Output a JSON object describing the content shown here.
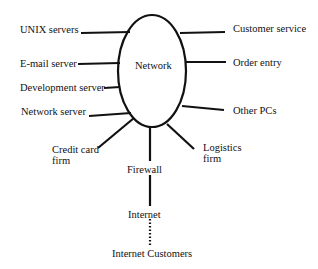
{
  "diagram": {
    "center": {
      "label": "Network"
    },
    "left_nodes": [
      {
        "id": "unix",
        "label": "UNIX servers"
      },
      {
        "id": "email",
        "label": "E-mail server"
      },
      {
        "id": "dev",
        "label": "Development server"
      },
      {
        "id": "netserver",
        "label": "Network server"
      }
    ],
    "right_nodes": [
      {
        "id": "custsvc",
        "label": "Customer service"
      },
      {
        "id": "order",
        "label": "Order entry"
      },
      {
        "id": "otherpcs",
        "label": "Other PCs"
      }
    ],
    "bottom_nodes": {
      "credit_card": {
        "line1": "Credit card",
        "line2": "firm"
      },
      "logistics": {
        "line1": "Logistics",
        "line2": "firm"
      },
      "firewall": {
        "label": "Firewall"
      },
      "internet": {
        "label": "Internet"
      },
      "internet_customers": {
        "label": "Internet Customers"
      }
    },
    "connections": [
      {
        "from": "UNIX servers",
        "to": "Network",
        "style": "solid"
      },
      {
        "from": "E-mail server",
        "to": "Network",
        "style": "solid"
      },
      {
        "from": "Development server",
        "to": "Network",
        "style": "solid"
      },
      {
        "from": "Network server",
        "to": "Network",
        "style": "solid"
      },
      {
        "from": "Customer service",
        "to": "Network",
        "style": "solid"
      },
      {
        "from": "Order entry",
        "to": "Network",
        "style": "solid"
      },
      {
        "from": "Other PCs",
        "to": "Network",
        "style": "solid"
      },
      {
        "from": "Credit card firm",
        "to": "Network",
        "style": "solid"
      },
      {
        "from": "Logistics firm",
        "to": "Network",
        "style": "solid"
      },
      {
        "from": "Firewall",
        "to": "Network",
        "style": "solid"
      },
      {
        "from": "Internet",
        "to": "Firewall",
        "style": "solid"
      },
      {
        "from": "Internet Customers",
        "to": "Internet",
        "style": "dotted"
      }
    ],
    "colors": {
      "line": "#111111",
      "background": "#ffffff"
    }
  }
}
